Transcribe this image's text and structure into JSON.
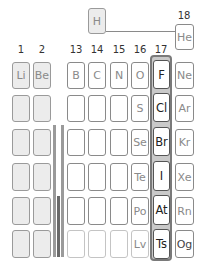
{
  "group_labels": {
    "g1": "1",
    "g2": "2",
    "g13": "13",
    "g14": "14",
    "g15": "15",
    "g16": "16",
    "g17": "17",
    "g18": "18"
  },
  "elements": {
    "H": "H",
    "He": "He",
    "Li": "Li",
    "Be": "Be",
    "B": "B",
    "C": "C",
    "N": "N",
    "O": "O",
    "F": "F",
    "Ne": "Ne",
    "S": "S",
    "Cl": "Cl",
    "Ar": "Ar",
    "Se": "Se",
    "Br": "Br",
    "Kr": "Kr",
    "Te": "Te",
    "I": "I",
    "Xe": "Xe",
    "Po": "Po",
    "At": "At",
    "Rn": "Rn",
    "Lv": "Lv",
    "Ts": "Ts",
    "Og": "Og"
  },
  "colors": {
    "highlight_group": "#222222",
    "muted_text": "#8a8a8a",
    "s_block_fill": "#ececec",
    "frame_fill": "#c9c9c9"
  }
}
